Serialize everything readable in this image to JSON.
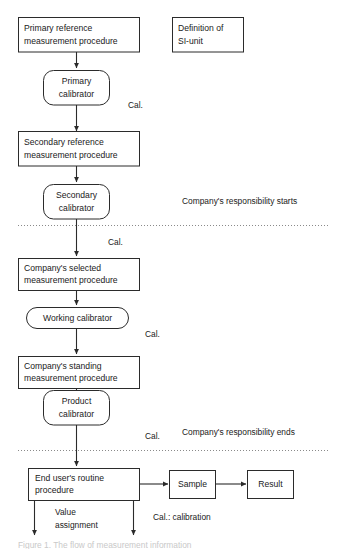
{
  "diagram": {
    "colors": {
      "background": "#ffffff",
      "stroke": "#2b2b2b",
      "divider": "#8a8a8a",
      "text": "#1a1a1a"
    },
    "nodes": {
      "primary_reference_procedure": {
        "line1": "Primary reference",
        "line2": "measurement procedure",
        "shape": "rectangle"
      },
      "definition_si_unit": {
        "line1": "Definition of",
        "line2": "SI-unit",
        "shape": "rectangle"
      },
      "primary_calibrator": {
        "line1": "Primary",
        "line2": "calibrator",
        "shape": "rounded"
      },
      "secondary_reference_procedure": {
        "line1": "Secondary reference",
        "line2": "measurement procedure",
        "shape": "rectangle"
      },
      "secondary_calibrator": {
        "line1": "Secondary",
        "line2": "calibrator",
        "shape": "rounded"
      },
      "company_selected_procedure": {
        "line1": "Company's selected",
        "line2": "measurement procedure",
        "shape": "rectangle"
      },
      "working_calibrator": {
        "line1": "Working calibrator",
        "shape": "rounded"
      },
      "company_standing_procedure": {
        "line1": "Company's standing",
        "line2": "measurement procedure",
        "shape": "rectangle"
      },
      "product_calibrator": {
        "line1": "Product",
        "line2": "calibrator",
        "shape": "rounded"
      },
      "end_user_routine_procedure": {
        "line1": "End user's routine",
        "line2": "procedure",
        "shape": "rectangle"
      },
      "sample": {
        "line1": "Sample",
        "shape": "rectangle"
      },
      "result": {
        "line1": "Result",
        "shape": "rectangle"
      }
    },
    "edge_labels": {
      "cal_1": "Cal.",
      "cal_2": "Cal.",
      "cal_3": "Cal.",
      "cal_4": "Cal."
    },
    "annotations": {
      "responsibility_starts": "Company's responsibility starts",
      "responsibility_ends": "Company's responsibility ends",
      "value_assignment_line1": "Value",
      "value_assignment_line2": "assignment",
      "legend_cal": "Cal.: calibration"
    },
    "caption": {
      "text": "Figure 1. The flow of measurement information"
    }
  }
}
